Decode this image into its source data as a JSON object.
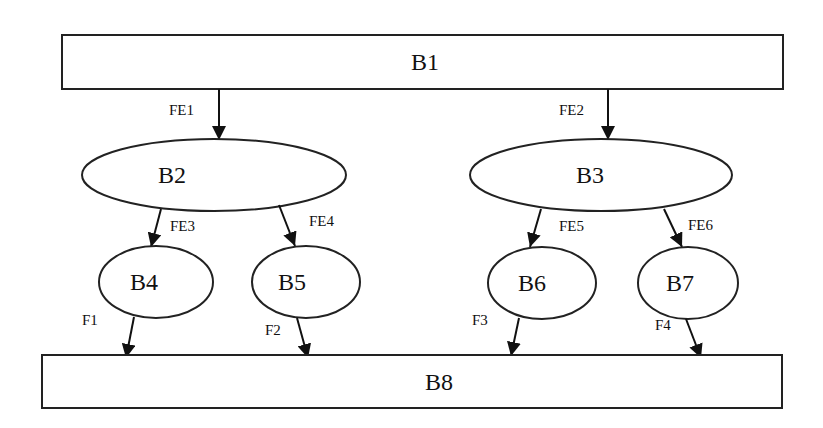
{
  "diagram": {
    "type": "hierarchical block diagram",
    "nodes": [
      {
        "id": "B1",
        "label": "B1",
        "shape": "rectangle"
      },
      {
        "id": "B2",
        "label": "B2",
        "shape": "ellipse"
      },
      {
        "id": "B3",
        "label": "B3",
        "shape": "ellipse"
      },
      {
        "id": "B4",
        "label": "B4",
        "shape": "ellipse"
      },
      {
        "id": "B5",
        "label": "B5",
        "shape": "ellipse"
      },
      {
        "id": "B6",
        "label": "B6",
        "shape": "ellipse"
      },
      {
        "id": "B7",
        "label": "B7",
        "shape": "ellipse"
      },
      {
        "id": "B8",
        "label": "B8",
        "shape": "rectangle"
      }
    ],
    "edges": [
      {
        "from": "B1",
        "to": "B2",
        "label": "FE1"
      },
      {
        "from": "B1",
        "to": "B3",
        "label": "FE2"
      },
      {
        "from": "B2",
        "to": "B4",
        "label": "FE3"
      },
      {
        "from": "B2",
        "to": "B5",
        "label": "FE4"
      },
      {
        "from": "B3",
        "to": "B6",
        "label": "FE5"
      },
      {
        "from": "B3",
        "to": "B7",
        "label": "FE6"
      },
      {
        "from": "B4",
        "to": "B8",
        "label": "F1"
      },
      {
        "from": "B5",
        "to": "B8",
        "label": "F2"
      },
      {
        "from": "B6",
        "to": "B8",
        "label": "F3"
      },
      {
        "from": "B7",
        "to": "B8",
        "label": "F4"
      }
    ]
  },
  "labels": {
    "b1": "B1",
    "b2": "B2",
    "b3": "B3",
    "b4": "B4",
    "b5": "B5",
    "b6": "B6",
    "b7": "B7",
    "b8": "B8",
    "fe1": "FE1",
    "fe2": "FE2",
    "fe3": "FE3",
    "fe4": "FE4",
    "fe5": "FE5",
    "fe6": "FE6",
    "f1": "F1",
    "f2": "F2",
    "f3": "F3",
    "f4": "F4"
  },
  "colors": {
    "background": "#ffffff",
    "stroke": "#222222",
    "text": "#111111"
  }
}
